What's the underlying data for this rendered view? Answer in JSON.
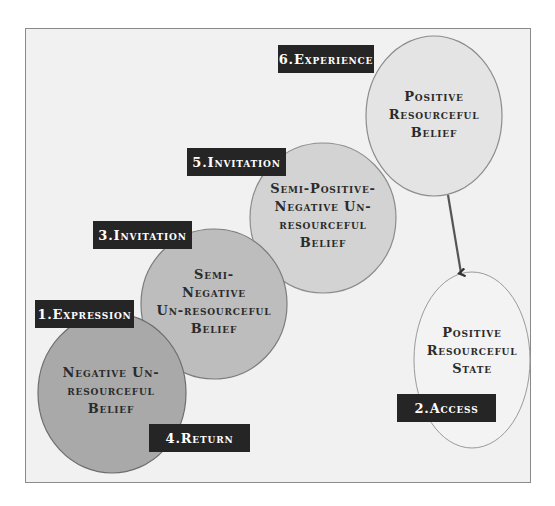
{
  "diagram": {
    "nodes": [
      {
        "id": "negative",
        "text": "Negative Un-resourceful Belief",
        "lines": [
          "Negative Un-",
          "resourceful",
          "Belief"
        ],
        "fill": "#a9a9a9"
      },
      {
        "id": "semi_negative",
        "text": "Semi-Negative Un-resourceful Belief",
        "lines": [
          "Semi-",
          "Negative",
          "Un-resourceful",
          "Belief"
        ],
        "fill": "#bdbdbd"
      },
      {
        "id": "semi_positive",
        "text": "Semi-Positive-Negative Un-resourceful Belief",
        "lines": [
          "Semi-Positive-",
          "Negative Un-",
          "resourceful",
          "Belief"
        ],
        "fill": "#d3d3d3"
      },
      {
        "id": "positive_belief",
        "text": "Positive Resourceful Belief",
        "lines": [
          "Positive",
          "Resourceful",
          "Belief"
        ],
        "fill": "#e4e4e4"
      },
      {
        "id": "positive_state",
        "text": "Positive Resourceful State",
        "lines": [
          "Positive",
          "Resourceful",
          "State"
        ],
        "fill": "#f3f3f3"
      }
    ],
    "labels": {
      "expression": "1.Expression",
      "access": "2.Access",
      "invitation_3": "3.Invitation",
      "return": "4.Return",
      "invitation_5": "5.Invitation",
      "experience": "6.Experience"
    },
    "colors": {
      "frame_bg": "#f1f1f1",
      "frame_border": "#8a8a8a",
      "label_bg": "#252525",
      "label_text": "#ffffff",
      "node_text": "#2b2b2b",
      "arrow": "#555555"
    }
  }
}
